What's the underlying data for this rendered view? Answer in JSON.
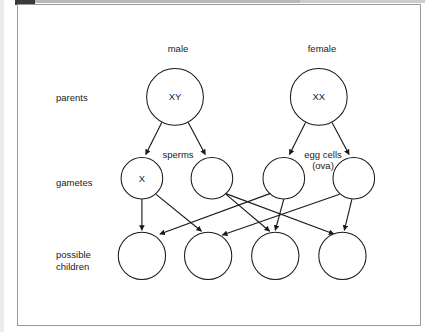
{
  "window": {
    "frame_border_color": "#9a9a9a",
    "background": "#ffffff",
    "tab_color": "#3a3a3a"
  },
  "diagram": {
    "title_sex_labels": {
      "male": "male",
      "female": "female"
    },
    "row_labels": {
      "parents": "parents",
      "gametes": "gametes",
      "children": "possible\nchildren"
    },
    "annotations": {
      "sperms": "sperms",
      "egg_cells_line1": "egg cells",
      "egg_cells_line2": "(ova)"
    },
    "parents": [
      {
        "id": "father",
        "label": "XY",
        "cx": 166,
        "cy": 94,
        "r": 30
      },
      {
        "id": "mother",
        "label": "XX",
        "cx": 318,
        "cy": 94,
        "r": 30
      }
    ],
    "gametes": [
      {
        "id": "sperm-x",
        "label": "X",
        "cx": 131,
        "cy": 180,
        "r": 22
      },
      {
        "id": "sperm-y",
        "label": "",
        "cx": 205,
        "cy": 180,
        "r": 22
      },
      {
        "id": "ovum-1",
        "label": "",
        "cx": 281,
        "cy": 180,
        "r": 22
      },
      {
        "id": "ovum-2",
        "label": "",
        "cx": 355,
        "cy": 180,
        "r": 22
      }
    ],
    "children": [
      {
        "id": "child-1",
        "label": "",
        "cx": 131,
        "cy": 262,
        "r": 25
      },
      {
        "id": "child-2",
        "label": "",
        "cx": 201,
        "cy": 262,
        "r": 25
      },
      {
        "id": "child-3",
        "label": "",
        "cx": 272,
        "cy": 262,
        "r": 25
      },
      {
        "id": "child-4",
        "label": "",
        "cx": 343,
        "cy": 262,
        "r": 25
      }
    ],
    "stroke_color": "#1a1a1a"
  }
}
